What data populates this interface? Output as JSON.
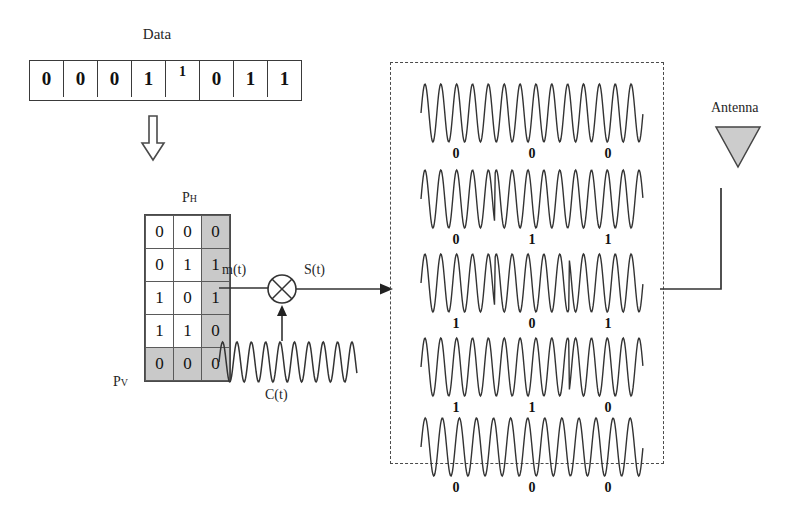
{
  "diagram": {
    "title_data": "Data",
    "data_bits": [
      {
        "value": "0",
        "raised": false
      },
      {
        "value": "0",
        "raised": false
      },
      {
        "value": "0",
        "raised": false
      },
      {
        "value": "1",
        "raised": false
      },
      {
        "value": "1",
        "raised": true
      },
      {
        "value": "0",
        "raised": false
      },
      {
        "value": "1",
        "raised": false
      },
      {
        "value": "1",
        "raised": false
      }
    ],
    "matrix": {
      "label_horizontal": "PH",
      "label_horizontal_base": "P",
      "label_horizontal_sub": "H",
      "label_vertical_base": "P",
      "label_vertical_sub": "V",
      "rows": [
        {
          "cells": [
            "0",
            "0",
            "0"
          ],
          "shaded_row": false
        },
        {
          "cells": [
            "0",
            "1",
            "1"
          ],
          "shaded_row": false
        },
        {
          "cells": [
            "1",
            "0",
            "1"
          ],
          "shaded_row": false
        },
        {
          "cells": [
            "1",
            "1",
            "0"
          ],
          "shaded_row": false
        },
        {
          "cells": [
            "0",
            "0",
            "0"
          ],
          "shaded_row": true
        }
      ],
      "shaded_column_index": 2
    },
    "signals": {
      "message": "m(t)",
      "modulated": "S(t)",
      "carrier": "C(t)"
    },
    "antenna": {
      "label": "Antenna",
      "fill_color": "#cccccc"
    },
    "transmitted_rows": [
      {
        "bits": [
          "0",
          "0",
          "0"
        ],
        "cycles": 14,
        "phase_flips": []
      },
      {
        "bits": [
          "0",
          "1",
          "1"
        ],
        "cycles": 14,
        "phase_flips": [
          1,
          2
        ]
      },
      {
        "bits": [
          "1",
          "0",
          "1"
        ],
        "cycles": 14,
        "phase_flips": [
          1
        ]
      },
      {
        "bits": [
          "1",
          "1",
          "0"
        ],
        "cycles": 14,
        "phase_flips": [
          2
        ]
      },
      {
        "bits": [
          "0",
          "0",
          "0"
        ],
        "cycles": 13,
        "phase_flips": []
      }
    ],
    "colors": {
      "ink": "#333333",
      "shade": "#c9c9c9",
      "dash_border": "#4a4a4a"
    }
  }
}
